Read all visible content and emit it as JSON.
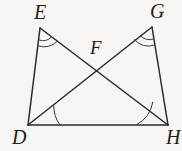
{
  "figure": {
    "kind": "geometry-diagram",
    "background_color": "#f6f5f3",
    "stroke_color": "#2a2a2a",
    "label_color": "#1d1d1d",
    "width": 182,
    "height": 151,
    "labels": {
      "E": "E",
      "G": "G",
      "F": "F",
      "D": "D",
      "H": "H"
    },
    "points": {
      "E": {
        "x": 40,
        "y": 28
      },
      "G": {
        "x": 152,
        "y": 27
      },
      "F": {
        "x": 96,
        "y": 68
      },
      "D": {
        "x": 28,
        "y": 125
      },
      "H": {
        "x": 168,
        "y": 125
      }
    },
    "segments": [
      {
        "name": "segment-ED",
        "from": "E",
        "to": "D"
      },
      {
        "name": "segment-GH",
        "from": "G",
        "to": "H"
      },
      {
        "name": "segment-DH",
        "from": "D",
        "to": "H"
      },
      {
        "name": "segment-EH",
        "from": "E",
        "to": "H"
      },
      {
        "name": "segment-DG",
        "from": "D",
        "to": "G"
      }
    ],
    "angle_marks": [
      {
        "name": "angle-E",
        "vertex": "E",
        "arcs": 2
      },
      {
        "name": "angle-G",
        "vertex": "G",
        "arcs": 2
      },
      {
        "name": "angle-D",
        "vertex": "D",
        "arcs": 1
      },
      {
        "name": "angle-H",
        "vertex": "H",
        "arcs": 1
      }
    ]
  }
}
